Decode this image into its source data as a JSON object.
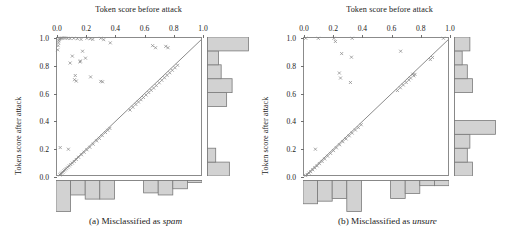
{
  "figure": {
    "panel_count": 2,
    "marker_color": "#8a8a8a",
    "hist_fill": "#d2d2d2",
    "hist_stroke": "#7a7a7a",
    "frame_color": "#8b8b8b",
    "diagonal_color": "#7d7d7d"
  },
  "panels": [
    {
      "id": "a",
      "caption_prefix": "(a) Misclassified as ",
      "caption_emphasis": "spam",
      "caption_full": "(a) Misclassified as spam"
    },
    {
      "id": "b",
      "caption_prefix": "(b) Misclassified as ",
      "caption_emphasis": "unsure",
      "caption_full": "(b) Misclassified as unsure"
    }
  ],
  "chart_data": [
    {
      "type": "scatter",
      "panel": "a",
      "title": "(a) Misclassified as spam",
      "xlabel": "Token score before attack",
      "ylabel": "Token score after attack",
      "xlim": [
        0.0,
        1.0
      ],
      "ylim": [
        0.0,
        1.0
      ],
      "xticks": [
        "0.0",
        "0.2",
        "0.4",
        "0.6",
        "0.8",
        "1.0"
      ],
      "yticks": [
        "0.0",
        "0.2",
        "0.4",
        "0.6",
        "0.8",
        "1.0"
      ],
      "xtick_values": [
        0.0,
        0.2,
        0.4,
        0.6,
        0.8,
        1.0
      ],
      "ytick_values": [
        0.0,
        0.2,
        0.4,
        0.6,
        0.8,
        1.0
      ],
      "grid": false,
      "legend": "none",
      "annotations": [
        "identity line y = x drawn as reference"
      ],
      "reference_line": {
        "type": "identity",
        "slope": 1,
        "intercept": 0
      },
      "marker": "x",
      "points": [
        [
          0.005,
          0.915
        ],
        [
          0.008,
          0.945
        ],
        [
          0.01,
          0.965
        ],
        [
          0.012,
          0.98
        ],
        [
          0.015,
          0.99
        ],
        [
          0.02,
          0.995
        ],
        [
          0.026,
          0.998
        ],
        [
          0.034,
          0.999
        ],
        [
          0.045,
          1.0
        ],
        [
          0.058,
          1.0
        ],
        [
          0.072,
          0.998
        ],
        [
          0.09,
          0.996
        ],
        [
          0.115,
          0.998
        ],
        [
          0.14,
          0.995
        ],
        [
          0.165,
          0.99
        ],
        [
          0.205,
          0.998
        ],
        [
          0.228,
          0.995
        ],
        [
          0.245,
          0.99
        ],
        [
          0.3,
          0.998
        ],
        [
          0.32,
          0.988
        ],
        [
          0.365,
          0.965
        ],
        [
          0.655,
          0.945
        ],
        [
          0.675,
          0.93
        ],
        [
          0.745,
          0.94
        ],
        [
          0.76,
          0.93
        ],
        [
          0.105,
          0.87
        ],
        [
          0.09,
          0.82
        ],
        [
          0.175,
          0.905
        ],
        [
          0.195,
          0.855
        ],
        [
          0.16,
          0.835
        ],
        [
          0.158,
          0.828
        ],
        [
          0.125,
          0.73
        ],
        [
          0.12,
          0.7
        ],
        [
          0.132,
          0.69
        ],
        [
          0.23,
          0.72
        ],
        [
          0.3,
          0.688
        ],
        [
          0.312,
          0.685
        ],
        [
          0.022,
          0.212
        ],
        [
          0.078,
          0.2
        ],
        [
          0.02,
          0.015
        ],
        [
          0.026,
          0.022
        ],
        [
          0.032,
          0.028
        ],
        [
          0.04,
          0.035
        ],
        [
          0.048,
          0.044
        ],
        [
          0.056,
          0.052
        ],
        [
          0.064,
          0.06
        ],
        [
          0.074,
          0.07
        ],
        [
          0.084,
          0.08
        ],
        [
          0.094,
          0.09
        ],
        [
          0.105,
          0.1
        ],
        [
          0.118,
          0.112
        ],
        [
          0.132,
          0.126
        ],
        [
          0.148,
          0.142
        ],
        [
          0.168,
          0.16
        ],
        [
          0.186,
          0.178
        ],
        [
          0.205,
          0.196
        ],
        [
          0.225,
          0.214
        ],
        [
          0.248,
          0.236
        ],
        [
          0.5,
          0.482
        ],
        [
          0.52,
          0.502
        ],
        [
          0.54,
          0.522
        ],
        [
          0.558,
          0.54
        ],
        [
          0.575,
          0.556
        ],
        [
          0.592,
          0.572
        ],
        [
          0.61,
          0.59
        ],
        [
          0.628,
          0.608
        ],
        [
          0.645,
          0.624
        ],
        [
          0.662,
          0.64
        ],
        [
          0.68,
          0.658
        ],
        [
          0.7,
          0.678
        ],
        [
          0.718,
          0.696
        ],
        [
          0.736,
          0.714
        ],
        [
          0.754,
          0.732
        ],
        [
          0.772,
          0.75
        ],
        [
          0.79,
          0.768
        ],
        [
          0.808,
          0.786
        ],
        [
          0.826,
          0.804
        ],
        [
          0.332,
          0.32
        ],
        [
          0.348,
          0.336
        ],
        [
          0.362,
          0.35
        ],
        [
          0.31,
          0.298
        ],
        [
          0.29,
          0.278
        ],
        [
          0.272,
          0.26
        ]
      ],
      "marginal_x_histogram": {
        "orientation": "down",
        "bin_edges": [
          0.0,
          0.1,
          0.2,
          0.3,
          0.4,
          0.5,
          0.6,
          0.7,
          0.8,
          0.9,
          1.0
        ],
        "counts": [
          15,
          7,
          9,
          9,
          0,
          0,
          6,
          7,
          4,
          1
        ]
      },
      "marginal_y_histogram": {
        "orientation": "right",
        "bin_edges": [
          0.0,
          0.1,
          0.2,
          0.3,
          0.4,
          0.5,
          0.6,
          0.7,
          0.8,
          0.9,
          1.0
        ],
        "counts": [
          8,
          3,
          0,
          0,
          0,
          7,
          9,
          5,
          4,
          15
        ]
      }
    },
    {
      "type": "scatter",
      "panel": "b",
      "title": "(b) Misclassified as unsure",
      "xlabel": "Token score before attack",
      "ylabel": "Token score after attack",
      "xlim": [
        0.0,
        1.0
      ],
      "ylim": [
        0.0,
        1.0
      ],
      "xticks": [
        "0.0",
        "0.2",
        "0.4",
        "0.6",
        "0.8",
        "1.0"
      ],
      "yticks": [
        "0.0",
        "0.2",
        "0.4",
        "0.6",
        "0.8",
        "1.0"
      ],
      "xtick_values": [
        0.0,
        0.2,
        0.4,
        0.6,
        0.8,
        1.0
      ],
      "ytick_values": [
        0.0,
        0.2,
        0.4,
        0.6,
        0.8,
        1.0
      ],
      "grid": false,
      "legend": "none",
      "annotations": [
        "identity line y = x drawn as reference"
      ],
      "reference_line": {
        "type": "identity",
        "slope": 1,
        "intercept": 0
      },
      "marker": "x",
      "points": [
        [
          0.012,
          0.998
        ],
        [
          0.098,
          0.998
        ],
        [
          0.205,
          0.998
        ],
        [
          0.215,
          0.975
        ],
        [
          0.33,
          0.998
        ],
        [
          0.955,
          0.998
        ],
        [
          0.258,
          0.888
        ],
        [
          0.325,
          0.862
        ],
        [
          0.662,
          0.905
        ],
        [
          0.242,
          0.748
        ],
        [
          0.25,
          0.712
        ],
        [
          0.318,
          0.68
        ],
        [
          0.745,
          0.74
        ],
        [
          0.752,
          0.728
        ],
        [
          0.76,
          0.738
        ],
        [
          0.078,
          0.2
        ],
        [
          0.012,
          0.01
        ],
        [
          0.022,
          0.018
        ],
        [
          0.034,
          0.028
        ],
        [
          0.046,
          0.038
        ],
        [
          0.06,
          0.052
        ],
        [
          0.074,
          0.066
        ],
        [
          0.09,
          0.08
        ],
        [
          0.106,
          0.096
        ],
        [
          0.124,
          0.112
        ],
        [
          0.142,
          0.13
        ],
        [
          0.162,
          0.15
        ],
        [
          0.182,
          0.17
        ],
        [
          0.202,
          0.19
        ],
        [
          0.222,
          0.21
        ],
        [
          0.244,
          0.232
        ],
        [
          0.266,
          0.254
        ],
        [
          0.288,
          0.274
        ],
        [
          0.31,
          0.296
        ],
        [
          0.33,
          0.316
        ],
        [
          0.352,
          0.338
        ],
        [
          0.372,
          0.356
        ],
        [
          0.392,
          0.376
        ],
        [
          0.64,
          0.622
        ],
        [
          0.66,
          0.642
        ],
        [
          0.68,
          0.662
        ],
        [
          0.7,
          0.68
        ],
        [
          0.718,
          0.698
        ],
        [
          0.73,
          0.712
        ],
        [
          0.865,
          0.845
        ],
        [
          0.88,
          0.86
        ]
      ],
      "marginal_x_histogram": {
        "orientation": "down",
        "bin_edges": [
          0.0,
          0.1,
          0.2,
          0.3,
          0.4,
          0.5,
          0.6,
          0.7,
          0.8,
          0.9,
          1.0
        ],
        "counts": [
          9,
          8,
          7,
          12,
          0,
          0,
          7,
          5,
          2,
          2
        ]
      },
      "marginal_y_histogram": {
        "orientation": "right",
        "bin_edges": [
          0.0,
          0.1,
          0.2,
          0.3,
          0.4,
          0.5,
          0.6,
          0.7,
          0.8,
          0.9,
          1.0
        ],
        "counts": [
          7,
          5,
          6,
          16,
          0,
          0,
          7,
          5,
          3,
          6
        ]
      }
    }
  ],
  "labels": {
    "x_axis_title": "Token score before attack",
    "y_axis_title": "Token score after attack"
  }
}
